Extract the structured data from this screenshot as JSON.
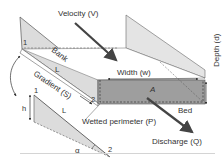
{
  "diagram": {
    "labels": {
      "velocity": "Velocity (V)",
      "width": "Width (w)",
      "depth": "Depth (d)",
      "bank": "Bank",
      "bank_length": "L",
      "gradient": "Gradient (S)",
      "area": "A",
      "bed": "Bed",
      "wetted_perimeter": "Wetted perimeter (P)",
      "discharge": "Discharge (Q)",
      "point_1_top": "1",
      "point_2_top": "2",
      "triangle_h": "h",
      "triangle_L": "L",
      "triangle_1": "1",
      "triangle_2": "2",
      "alpha": "α"
    },
    "colors": {
      "bank_fill": "#dcdcdc",
      "cross_section_fill": "#9e9e9e",
      "arrow": "#444444",
      "line": "#555555",
      "text": "#333333",
      "rule": "#d4d4d4"
    }
  }
}
